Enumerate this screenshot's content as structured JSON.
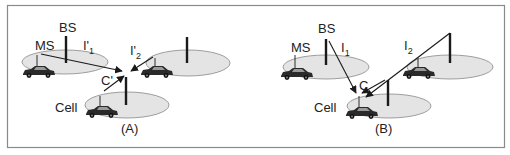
{
  "panels": [
    {
      "id": "A",
      "caption": "(A)",
      "labels": {
        "bs": "BS",
        "ms": "MS",
        "cell": "Cell",
        "i1_main": "I'",
        "i1_sub": "1",
        "i2_main": "I'",
        "i2_sub": "2",
        "c": "C'"
      }
    },
    {
      "id": "B",
      "caption": "(B)",
      "labels": {
        "bs": "BS",
        "ms": "MS",
        "cell": "Cell",
        "i1_main": "I",
        "i1_sub": "1",
        "i2_main": "I",
        "i2_sub": "2",
        "c": "C"
      }
    }
  ],
  "colors": {
    "cell_fill": "#e4e4e4",
    "cell_stroke": "#888888",
    "line": "#1a1a1a",
    "frame": "#8a8a8a",
    "car": "#2a2a2a"
  }
}
